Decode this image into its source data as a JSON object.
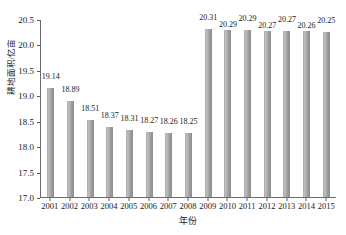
{
  "chart_data": {
    "type": "bar",
    "title": "",
    "xlabel": "年份",
    "ylabel": "耕地面积/亿亩",
    "categories": [
      "2001",
      "2002",
      "2003",
      "2004",
      "2005",
      "2006",
      "2007",
      "2008",
      "2009",
      "2010",
      "2011",
      "2012",
      "2013",
      "2014",
      "2015"
    ],
    "values": [
      19.14,
      18.89,
      18.51,
      18.37,
      18.31,
      18.27,
      18.26,
      18.25,
      20.31,
      20.29,
      20.29,
      20.27,
      20.27,
      20.26,
      20.25
    ],
    "data_labels": [
      "19.14",
      "18.89",
      "18.51",
      "18.37",
      "18.31",
      "18.27",
      "18.26",
      "18.25",
      "20.31",
      "20.29",
      "20.29",
      "20.27",
      "20.27",
      "20.26",
      "20.25"
    ],
    "label_raised": [
      true,
      true,
      true,
      true,
      true,
      true,
      true,
      true,
      true,
      false,
      true,
      false,
      true,
      false,
      true
    ],
    "ylim": [
      17.0,
      20.5
    ],
    "yticks": [
      17.0,
      17.5,
      18.0,
      18.5,
      19.0,
      19.5,
      20.0,
      20.5
    ],
    "ytick_labels": [
      "17.0",
      "17.5",
      "18.0",
      "18.5",
      "19.0",
      "19.5",
      "20.0",
      "20.5"
    ],
    "grid": false,
    "legend": null,
    "legend_position": "none",
    "bar_color": "#a6a6a6",
    "axis_color": "#6b6b6b",
    "text_color": "#1a1a1a"
  }
}
